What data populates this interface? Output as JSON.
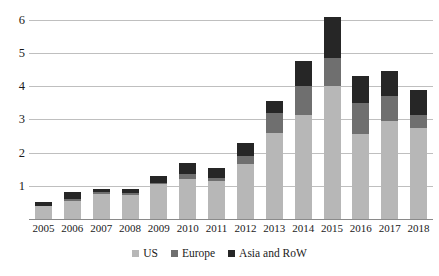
{
  "chart_data": {
    "type": "bar",
    "subtype": "stacked-vertical",
    "title": "",
    "subtitle": "",
    "xlabel": "",
    "ylabel": "",
    "categories": [
      "2005",
      "2006",
      "2007",
      "2008",
      "2009",
      "2010",
      "2011",
      "2012",
      "2013",
      "2014",
      "2015",
      "2016",
      "2017",
      "2018"
    ],
    "series": [
      {
        "name": "US",
        "color": "#b7b7b7",
        "values": [
          0.38,
          0.55,
          0.75,
          0.72,
          1.05,
          1.2,
          1.15,
          1.65,
          2.6,
          3.15,
          4.0,
          2.55,
          2.95,
          2.75
        ]
      },
      {
        "name": "Europe",
        "color": "#6f6f6f",
        "values": [
          0.0,
          0.05,
          0.05,
          0.05,
          0.05,
          0.15,
          0.1,
          0.25,
          0.6,
          0.85,
          0.85,
          0.95,
          0.75,
          0.4
        ]
      },
      {
        "name": "Asia and RoW",
        "color": "#262626",
        "values": [
          0.12,
          0.2,
          0.12,
          0.13,
          0.2,
          0.35,
          0.3,
          0.4,
          0.35,
          0.75,
          1.25,
          0.8,
          0.75,
          0.75
        ]
      }
    ],
    "totals": [
      0.5,
      0.8,
      0.92,
      0.9,
      1.3,
      1.7,
      1.55,
      2.3,
      3.55,
      4.75,
      6.1,
      4.3,
      4.45,
      3.9
    ],
    "ylim": [
      0,
      6.3
    ],
    "yticks": [
      1,
      2,
      3,
      4,
      5,
      6
    ],
    "ytick_labels": [
      "1",
      "2",
      "3",
      "4",
      "5",
      "6"
    ],
    "grid": true,
    "grid_axis": "y",
    "legend_position": "bottom-center",
    "legend_entries": [
      "US",
      "Europe",
      "Asia and RoW"
    ],
    "annotations": []
  },
  "colors": {
    "us": "#b7b7b7",
    "europe": "#6f6f6f",
    "asia": "#262626",
    "gridline": "#bfbfbf",
    "baseline": "#8a8a8a",
    "text": "#1a1a1a",
    "background": "#ffffff"
  }
}
